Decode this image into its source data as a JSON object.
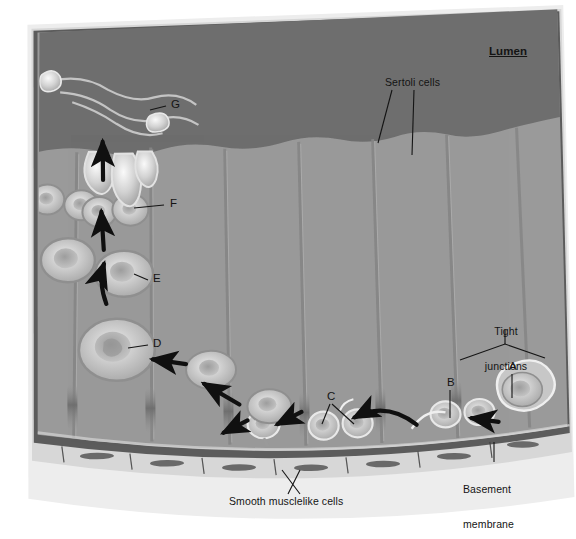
{
  "figure": {
    "title_visible": false,
    "type": "biology-diagram",
    "background_color": "#ffffff",
    "colors": {
      "page": "#ffffff",
      "outer_tissue": "#d9d9d9",
      "pale_band": "#e6e6e6",
      "basement_membrane": "#5b5b5b",
      "smooth_muscle": "#4f4f4f",
      "tubule_interior": "#9a9a9a",
      "lumen": "#6e6e6e",
      "sertoli_boundary": "#8a8a8a",
      "cell_fill": "#b3b3b3",
      "cell_highlight": "#e8e8e8",
      "cell_outline": "#8f8f8f",
      "arrow": "#101010",
      "label_text": "#141414",
      "leader_line": "#141414"
    }
  },
  "labels": {
    "lumen": {
      "text": "Lumen",
      "x": 489,
      "y": 53,
      "style": "underline-bold"
    },
    "sertoli_cells": {
      "text": "Sertoli cells",
      "x": 385,
      "y": 82,
      "style": "plain"
    },
    "tight_junctions": {
      "line1": "Tight",
      "line2": "junctions",
      "x": 505,
      "y": 313,
      "style": "centered"
    },
    "basement_membrane": {
      "line1": "Basement",
      "line2": "membrane",
      "x": 463,
      "y": 466,
      "style": "plain"
    },
    "smooth_musclelike_cells": {
      "text": "Smooth musclelike cells",
      "x": 229,
      "y": 501,
      "style": "plain"
    }
  },
  "letter_labels": [
    {
      "id": "A",
      "text": "A",
      "x": 509,
      "y": 367,
      "points_to": "spermatogonium at basement membrane",
      "leader": "vertical-down"
    },
    {
      "id": "B",
      "text": "B",
      "x": 447,
      "y": 383,
      "points_to": "spermatogonium",
      "leader": "vertical-down"
    },
    {
      "id": "C",
      "text": "C",
      "x": 328,
      "y": 398,
      "points_to": "pair of adjacent cells",
      "leader": "two-branch"
    },
    {
      "id": "D",
      "text": "D",
      "x": 153,
      "y": 343,
      "points_to": "primary spermatocyte",
      "leader": "horizontal-left"
    },
    {
      "id": "E",
      "text": "E",
      "x": 153,
      "y": 278,
      "points_to": "secondary spermatocyte",
      "leader": "horizontal-left"
    },
    {
      "id": "F",
      "text": "F",
      "x": 170,
      "y": 203,
      "points_to": "spermatid",
      "leader": "horizontal-left"
    },
    {
      "id": "G",
      "text": "G",
      "x": 171,
      "y": 104,
      "points_to": "spermatozoon head in lumen",
      "leader": "horizontal-left"
    }
  ],
  "annotations": {
    "progression_arrows": 7,
    "arrow_direction": "from basement membrane toward lumen",
    "sertoli_columns": 9
  }
}
